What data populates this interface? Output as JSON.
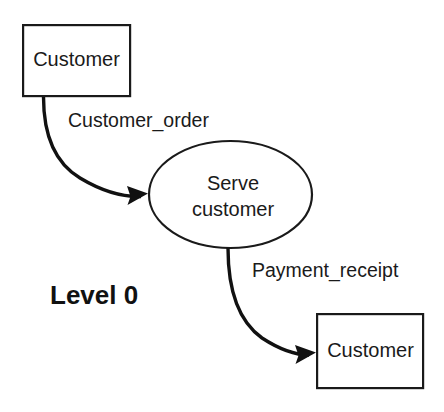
{
  "diagram": {
    "caption": "Level 0",
    "type": "data-flow-diagram",
    "nodes": [
      {
        "id": "external-entity-customer-source",
        "kind": "external-entity",
        "label": "Customer",
        "shape": "rectangle",
        "x": 22,
        "y": 24,
        "width": 109,
        "height": 73
      },
      {
        "id": "process-serve-customer",
        "kind": "process",
        "label_line1": "Serve",
        "label_line2": "customer",
        "shape": "ellipse",
        "cx": 230,
        "cy": 194,
        "rx": 82,
        "ry": 54
      },
      {
        "id": "external-entity-customer-sink",
        "kind": "external-entity",
        "label": "Customer",
        "shape": "rectangle",
        "x": 316,
        "y": 313,
        "width": 108,
        "height": 76
      }
    ],
    "flows": [
      {
        "id": "flow-customer-order",
        "label": "Customer_order",
        "from": "external-entity-customer-source",
        "to": "process-serve-customer",
        "label_x": 68,
        "label_y": 122
      },
      {
        "id": "flow-payment-receipt",
        "label": "Payment_receipt",
        "from": "process-serve-customer",
        "to": "external-entity-customer-sink",
        "label_x": 252,
        "label_y": 272
      }
    ],
    "caption_x": 50,
    "caption_y": 297,
    "colors": {
      "background": "#ffffff",
      "stroke": "#1a1a1a",
      "flow_stroke": "#111111",
      "text": "#1a1a1a"
    }
  }
}
